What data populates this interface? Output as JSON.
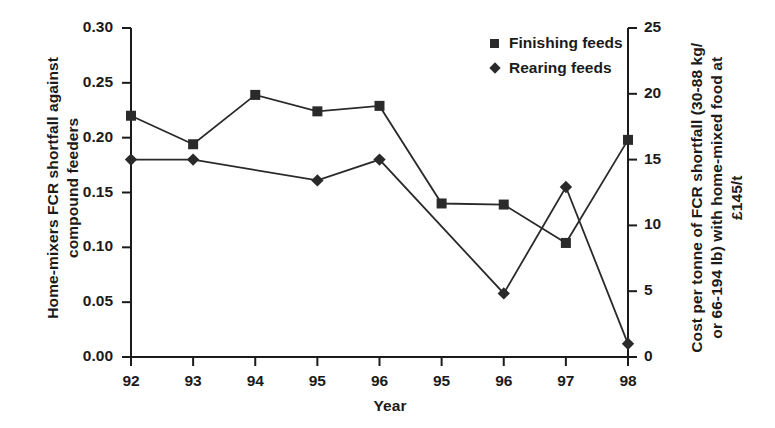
{
  "chart_data": {
    "type": "line",
    "title": "",
    "xlabel": "Year",
    "ylabel": "Home-mixers FCR shortfall against compound feeders",
    "ylabel_right": "Cost per tonne of FCR shortfall (30-88 kg/ or 66-194 lb) with home-mixed food at £145/t",
    "categories": [
      "92",
      "93",
      "94",
      "95",
      "96",
      "95",
      "96",
      "97",
      "98"
    ],
    "series": [
      {
        "name": "Finishing feeds",
        "marker": "square",
        "values": [
          0.22,
          0.194,
          0.239,
          0.224,
          0.229,
          0.14,
          0.139,
          0.104,
          0.198
        ]
      },
      {
        "name": "Rearing feeds",
        "marker": "diamond",
        "values": [
          0.18,
          0.18,
          null,
          0.161,
          0.18,
          null,
          0.058,
          0.155,
          0.012
        ]
      }
    ],
    "ylim": [
      0.0,
      0.3
    ],
    "yticks": [
      "0.00",
      "0.05",
      "0.10",
      "0.15",
      "0.20",
      "0.25",
      "0.30"
    ],
    "ylim_right": [
      0,
      25
    ],
    "yticks_right": [
      "0",
      "5",
      "10",
      "15",
      "20",
      "25"
    ],
    "grid": false,
    "legend_position": "top-right",
    "line_color": "#2a2a2a",
    "marker_color": "#2a2a2a",
    "axis_color": "#1b1b1b"
  },
  "axes": {
    "left_title": "Home-mixers FCR shortfall against\ncompound feeders",
    "right_title": "Cost per tonne of FCR shortfall (30-88 kg/\nor 66-194 lb) with home-mixed food at £145/t",
    "x_title": "Year"
  },
  "legend": {
    "items": [
      {
        "label": "Finishing feeds",
        "marker": "square-marker"
      },
      {
        "label": "Rearing feeds",
        "marker": "diamond-marker"
      }
    ]
  }
}
